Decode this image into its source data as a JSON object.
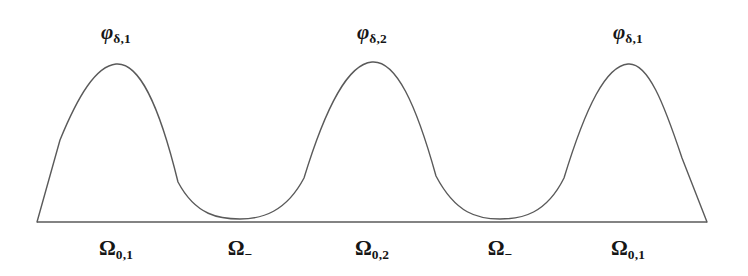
{
  "figure": {
    "name": "three-bump-partition-of-unity-diagram",
    "background_color": "#ffffff",
    "curve_color": "#5a5a5a",
    "baseline_color": "#5a5a5a",
    "text_color": "#161616",
    "top_labels": [
      {
        "base": "φ",
        "sub": "δ,1",
        "x": 116
      },
      {
        "base": "φ",
        "sub": "δ,2",
        "x": 372
      },
      {
        "base": "φ",
        "sub": "δ,1",
        "x": 628
      }
    ],
    "bottom_labels": [
      {
        "base": "Ω",
        "sub": "0,1",
        "x": 116
      },
      {
        "base": "Ω",
        "sub": "−",
        "x": 240
      },
      {
        "base": "Ω",
        "sub": "0,2",
        "x": 372
      },
      {
        "base": "Ω",
        "sub": "−",
        "x": 500
      },
      {
        "base": "Ω",
        "sub": "0,1",
        "x": 628
      }
    ]
  },
  "chart_data": {
    "type": "line",
    "title": "",
    "xlabel": "",
    "ylabel": "",
    "grid": false,
    "legend_position": "none",
    "xlim": [
      37,
      707
    ],
    "ylim": [
      0,
      1
    ],
    "baseline": {
      "x_start": 37,
      "x_end": 707,
      "y": 222
    },
    "annotations_top": [
      "φδ,1",
      "φδ,2",
      "φδ,1"
    ],
    "annotations_bottom": [
      "Ω₀,₁",
      "Ω₋",
      "Ω₀,₂",
      "Ω₋",
      "Ω₀,₁"
    ],
    "peaks": [
      {
        "label": "φδ,1",
        "x": 116,
        "y": 64,
        "height": 1.0
      },
      {
        "label": "φδ,2",
        "x": 372,
        "y": 62,
        "height": 1.0
      },
      {
        "label": "φδ,1",
        "x": 628,
        "y": 64,
        "height": 1.0
      }
    ],
    "valleys": [
      {
        "label": "Ω₋",
        "x": 240,
        "y": 219,
        "height": 0.02
      },
      {
        "label": "Ω₋",
        "x": 500,
        "y": 219,
        "height": 0.02
      }
    ],
    "path": "M 37 222 L 60 140 C 78 96 96 66 116 64 C 138 62 158 100 178 182 C 196 216 220 219 240 219 C 262 219 286 212 304 178 C 326 106 348 64 372 62 C 396 60 416 104 436 176 C 456 214 478 219 500 219 C 522 219 546 214 564 178 C 586 106 606 66 628 64 C 648 62 664 104 682 158 L 707 222"
  }
}
